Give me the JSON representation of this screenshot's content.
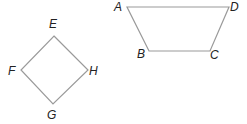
{
  "diagram": {
    "stroke_color": "#9a9a9a",
    "label_color": "#222222",
    "shapes": [
      {
        "name": "quadrilateral-EFGH",
        "type": "square",
        "vertices": [
          {
            "label": "E",
            "x": 54,
            "y": 36
          },
          {
            "label": "H",
            "x": 88,
            "y": 70
          },
          {
            "label": "G",
            "x": 53,
            "y": 104
          },
          {
            "label": "F",
            "x": 21,
            "y": 70
          }
        ]
      },
      {
        "name": "quadrilateral-ABCD",
        "type": "trapezoid",
        "vertices": [
          {
            "label": "A",
            "x": 127,
            "y": 7
          },
          {
            "label": "D",
            "x": 229,
            "y": 7
          },
          {
            "label": "C",
            "x": 210,
            "y": 51
          },
          {
            "label": "B",
            "x": 149,
            "y": 51
          }
        ]
      }
    ],
    "labels": {
      "E": "E",
      "F": "F",
      "G": "G",
      "H": "H",
      "A": "A",
      "B": "B",
      "C": "C",
      "D": "D"
    }
  }
}
